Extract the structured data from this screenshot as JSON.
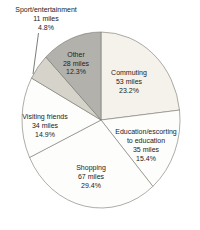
{
  "page": {
    "background": "#ffffff"
  },
  "chart_data": {
    "type": "pie",
    "title": "",
    "unit": "miles",
    "direction": "clockwise",
    "start_angle_deg": 0,
    "legend_position": "labels-on-and-around-slices",
    "stroke_color": "#76766f",
    "label_color": "#232323",
    "slices": [
      {
        "name_lines": [
          "Commuting"
        ],
        "value": 53,
        "pct": 23.2,
        "miles_label": "53 miles",
        "pct_label": "23.2%",
        "color": "#f4f2ea"
      },
      {
        "name_lines": [
          "Education/escorting",
          "to education"
        ],
        "value": 35,
        "pct": 15.4,
        "miles_label": "35 miles",
        "pct_label": "15.4%",
        "color": "#fdfdfc"
      },
      {
        "name_lines": [
          "Shopping"
        ],
        "value": 67,
        "pct": 29.4,
        "miles_label": "67 miles",
        "pct_label": "29.4%",
        "color": "#fdfdfc"
      },
      {
        "name_lines": [
          "Visiting friends"
        ],
        "value": 34,
        "pct": 14.9,
        "miles_label": "34 miles",
        "pct_label": "14.9%",
        "color": "#fdfdfc"
      },
      {
        "name_lines": [
          "Sport/entertainment"
        ],
        "value": 11,
        "pct": 4.8,
        "miles_label": "11 miles",
        "pct_label": "4.8%",
        "color": "#d6d3ca"
      },
      {
        "name_lines": [
          "Other"
        ],
        "value": 28,
        "pct": 12.3,
        "miles_label": "28 miles",
        "pct_label": "12.3%",
        "color": "#b3b1ac"
      }
    ]
  }
}
